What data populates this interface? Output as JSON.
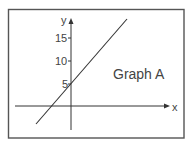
{
  "graph": {
    "title": "Graph A",
    "x_axis_label": "x",
    "y_axis_label": "y",
    "y_ticks": [
      {
        "label": "5",
        "value": 5
      },
      {
        "label": "10",
        "value": 10
      },
      {
        "label": "15",
        "value": 15
      }
    ],
    "line": {
      "slope": "positive",
      "y_intercept": 5
    },
    "colors": {
      "frame": "#555555",
      "axes": "#333333",
      "line": "#333333",
      "text": "#444444"
    }
  }
}
